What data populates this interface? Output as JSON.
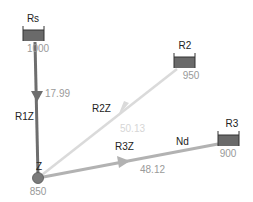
{
  "diagram": {
    "type": "water-network",
    "colors": {
      "pipe_dark": "#6e6e6e",
      "pipe_gray": "#b2b2b2",
      "pipe_light": "#dadada",
      "tank_fill": "#6a6a6a",
      "node_fill": "#7a7a7a",
      "label": "#222222",
      "value": "#999999"
    },
    "reservoirs": [
      {
        "id": "Rs",
        "label": "Rs",
        "head": "1000"
      },
      {
        "id": "R2",
        "label": "R2",
        "head": "950"
      },
      {
        "id": "R3",
        "label": "R3",
        "head": "900"
      }
    ],
    "junction": {
      "id": "Z",
      "label": "Z",
      "head": "850"
    },
    "pipes": [
      {
        "id": "R1Z",
        "label": "R1Z",
        "flow": "17.99"
      },
      {
        "id": "R2Z",
        "label": "R2Z",
        "flow": "50.13"
      },
      {
        "id": "R3Z",
        "label": "R3Z",
        "flow": "48.12",
        "extra_label": "Nd"
      }
    ]
  }
}
